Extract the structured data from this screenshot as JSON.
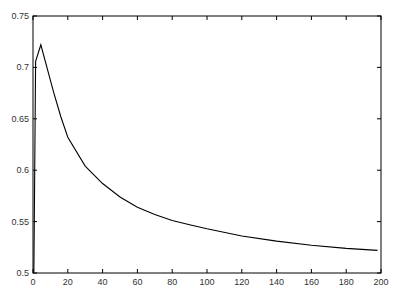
{
  "chart_data": {
    "type": "line",
    "title": "",
    "xlabel": "",
    "ylabel": "",
    "xlim": [
      0,
      200
    ],
    "ylim": [
      0.5,
      0.75
    ],
    "grid": false,
    "legend": null,
    "x_ticks": [
      "0",
      "20",
      "40",
      "60",
      "80",
      "100",
      "120",
      "140",
      "160",
      "180",
      "200"
    ],
    "y_ticks": [
      "0.5",
      "0.55",
      "0.6",
      "0.65",
      "0.7",
      "0.75"
    ],
    "series": [
      {
        "name": "curve",
        "color": "#000000",
        "x": [
          0.5,
          1.5,
          4.5,
          8,
          12,
          16,
          20,
          30,
          40,
          50,
          60,
          70,
          80,
          90,
          100,
          120,
          140,
          160,
          180,
          198
        ],
        "y": [
          0.5,
          0.706,
          0.722,
          0.7,
          0.675,
          0.652,
          0.632,
          0.604,
          0.587,
          0.574,
          0.564,
          0.557,
          0.551,
          0.547,
          0.543,
          0.536,
          0.531,
          0.527,
          0.524,
          0.522
        ]
      }
    ]
  }
}
